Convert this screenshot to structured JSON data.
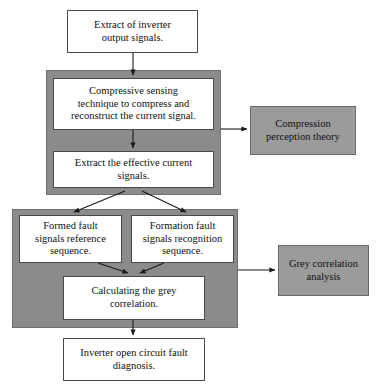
{
  "diagram": {
    "type": "flowchart",
    "colors": {
      "group_fill": "#8b8b8b",
      "note_fill": "#9b9b9b",
      "box_fill": "#ffffff",
      "stroke": "#4a4a4a",
      "text": "#111111"
    },
    "nodes": {
      "extract_inverter": {
        "label": "Extract of inverter\noutput signals.",
        "kind": "process-white"
      },
      "compressive_sensing": {
        "label": "Compressive sensing\ntechnique to compress and\nreconstruct the current signal.",
        "kind": "process-white"
      },
      "extract_effective": {
        "label": "Extract the effective current\nsignals.",
        "kind": "process-white"
      },
      "compression_theory": {
        "label": "Compression\nperception theory",
        "kind": "annotation-gray"
      },
      "formed_fault": {
        "label": "Formed fault\nsignals reference\nsequence.",
        "kind": "process-white"
      },
      "formation_fault": {
        "label": "Formation fault\nsignals recognition\nsequence.",
        "kind": "process-white"
      },
      "calculating_grey": {
        "label": "Calculating the grey\ncorrelation.",
        "kind": "process-white"
      },
      "grey_analysis": {
        "label": "Grey correlation\nanalysis",
        "kind": "annotation-gray"
      },
      "inverter_diagnosis": {
        "label": "Inverter open circuit fault\ndiagnosis.",
        "kind": "process-white"
      }
    },
    "groups": {
      "compressive_stage": {
        "label": ""
      },
      "grey_stage": {
        "label": ""
      }
    },
    "edges": [
      {
        "from": "extract_inverter",
        "to": "compressive_sensing",
        "style": "arrow-down"
      },
      {
        "from": "compressive_sensing",
        "to": "extract_effective",
        "style": "arrow-down"
      },
      {
        "from": "compressive_stage",
        "to": "compression_theory",
        "style": "arrow-right"
      },
      {
        "from": "extract_effective",
        "to": "formed_fault",
        "style": "arrow-diagonal"
      },
      {
        "from": "extract_effective",
        "to": "formation_fault",
        "style": "arrow-diagonal"
      },
      {
        "from": "formed_fault",
        "to": "calculating_grey",
        "style": "arrow-diagonal"
      },
      {
        "from": "formation_fault",
        "to": "calculating_grey",
        "style": "arrow-diagonal"
      },
      {
        "from": "grey_stage",
        "to": "grey_analysis",
        "style": "arrow-right"
      },
      {
        "from": "calculating_grey",
        "to": "inverter_diagnosis",
        "style": "arrow-down"
      }
    ]
  }
}
